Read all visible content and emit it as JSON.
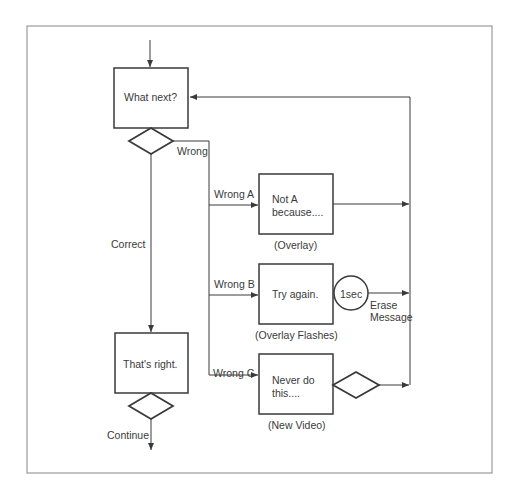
{
  "diagram": {
    "frame": {
      "stroke": "#9a9a9a"
    },
    "line_color": "#3a3a3a",
    "nodes": {
      "what_next": {
        "label": "What next?"
      },
      "thats_right": {
        "label": "That's right."
      },
      "box_a": {
        "line1": "Not A",
        "line2": "because....",
        "caption": "(Overlay)"
      },
      "box_b": {
        "label": "Try again.",
        "caption": "(Overlay Flashes)"
      },
      "box_c": {
        "line1": "Never do",
        "line2": "this....",
        "caption": "(New Video)"
      },
      "timer": {
        "label": "1sec"
      }
    },
    "edge_labels": {
      "wrong": "Wrong",
      "correct": "Correct",
      "wrong_a": "Wrong A",
      "wrong_b": "Wrong B",
      "wrong_c": "Wrong C",
      "erase_line1": "Erase",
      "erase_line2": "Message",
      "continue": "Continue"
    }
  }
}
